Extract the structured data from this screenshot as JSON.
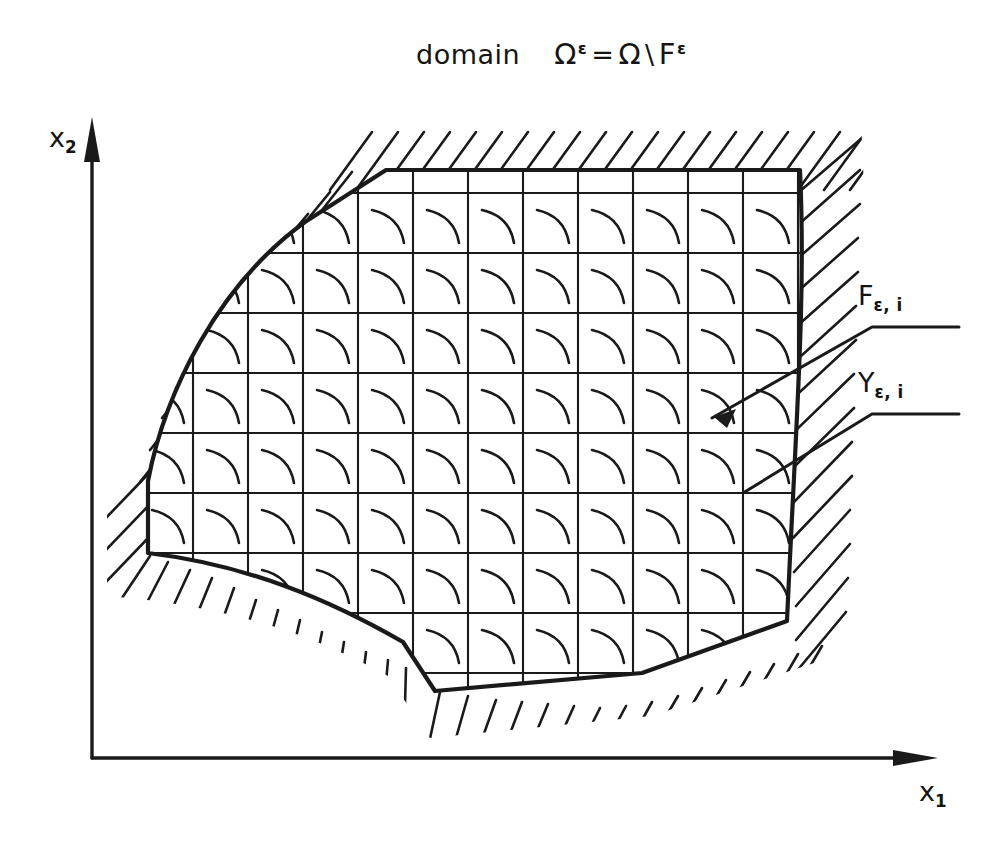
{
  "figure": {
    "title": {
      "word": "domain",
      "expression": "Ωε = Ω \\ Fε",
      "lhs_base": "Ω",
      "lhs_sup": "ε",
      "equals": "=",
      "rhs_base": "Ω",
      "setminus": "\\",
      "rhs_term_base": "F",
      "rhs_term_sup": "ε"
    },
    "axes": {
      "x": {
        "label_base": "x",
        "label_sub": "1",
        "name": "x1"
      },
      "y": {
        "label_base": "x",
        "label_sub": "2",
        "name": "x2"
      },
      "origin_x": 92,
      "origin_y": 758
    },
    "callouts": [
      {
        "id": "F",
        "label_base": "F",
        "label_sub": "ε, i",
        "target": "perforation-arc",
        "has_arrowhead": true
      },
      {
        "id": "Y",
        "label_base": "Y",
        "label_sub": "ε, i",
        "target": "grid-cell-corner",
        "has_arrowhead": false
      }
    ],
    "grid": {
      "description": "periodic square lattice of cells Y-epsilon-i each containing one arc-shaped inclusion F-epsilon-i",
      "cell_width": 55,
      "cell_height": 60,
      "columns_x": [
        193,
        248,
        303,
        358,
        413,
        468,
        523,
        578,
        633,
        688,
        743,
        798
      ],
      "rows_y": [
        193,
        253,
        313,
        373,
        433,
        493,
        553,
        613,
        673
      ],
      "arc_shape": "concave-up-right quarter arc from cell upper-left toward cell lower-right"
    },
    "domain_boundary": {
      "kind": "closed curvilinear polygon",
      "hatching": "outside",
      "vertices_note": "flat top, gently convex upper-left, near-vertical right, V-notched bottom"
    },
    "colors": {
      "ink": "#1a1a1a",
      "background": "#ffffff"
    }
  }
}
